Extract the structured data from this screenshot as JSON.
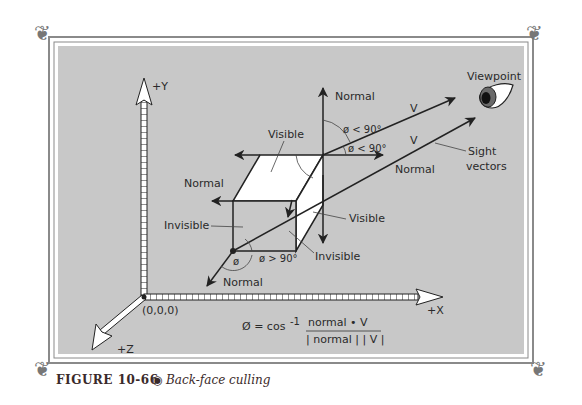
{
  "figure": {
    "number_label": "FIGURE 10-66",
    "bullet": "◉",
    "title": "Back-face culling"
  },
  "colors": {
    "panel_bg": "#c8c8c8",
    "frame": "#8a8a8a",
    "ink": "#222222",
    "face_white": "#ffffff"
  },
  "axes": {
    "y_label": "+Y",
    "x_label": "+X",
    "z_label": "+Z",
    "origin_label": "(0,0,0)"
  },
  "labels": {
    "viewpoint": "Viewpoint",
    "normal_top": "Normal",
    "normal_right": "Normal",
    "normal_left": "Normal",
    "normal_bottom": "Normal",
    "v_upper": "V",
    "v_lower": "V",
    "angle_upper": "ø < 90°",
    "angle_lower": "ø < 90°",
    "angle_bottom": "ø > 90°",
    "phi": "ø",
    "visible_top": "Visible",
    "visible_side": "Visible",
    "invisible_left": "Invisible",
    "invisible_bottom": "Invisible",
    "sight_vectors_1": "Sight",
    "sight_vectors_2": "vectors"
  },
  "formula": {
    "lhs": "Ø = cos",
    "sup": "-1",
    "numerator": "normal • V",
    "denominator": "| normal | | V |"
  }
}
